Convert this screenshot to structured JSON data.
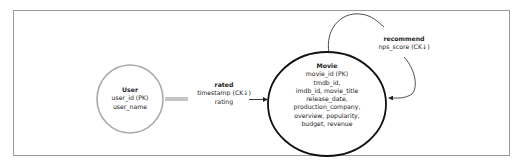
{
  "diagram": {
    "entities": [
      {
        "name": "User",
        "attributes": [
          "user_id (PK)",
          "user_name"
        ],
        "border_color": "#a0a0a0"
      },
      {
        "name": "Movie",
        "attributes": [
          "movie_id (PK)",
          "tmdb_id,",
          "imdb_id, movie_title",
          "release_date,",
          "production_company,",
          "overview, popularity,",
          "budget, revenue"
        ],
        "border_color": "#111111"
      }
    ],
    "relationships": [
      {
        "name": "rated",
        "attributes": [
          "timestamp (CK↓)",
          "rating"
        ],
        "from": "User",
        "to": "Movie"
      },
      {
        "name": "recommend",
        "attributes": [
          "nps_score (CK↓)"
        ],
        "from": "Movie",
        "to": "Movie"
      }
    ]
  }
}
